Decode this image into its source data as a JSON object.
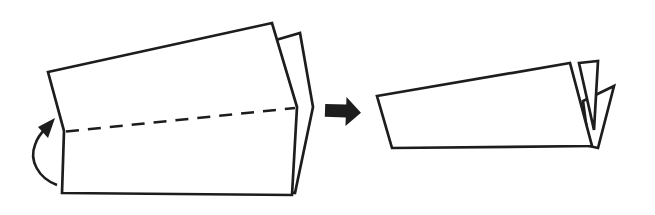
{
  "colors": {
    "background": "#ffffff",
    "paper": "#ffffff",
    "line": "#1d1d1d",
    "arrow_fill": "#1d1d1d"
  },
  "diagram": {
    "type": "origami-instruction-step",
    "step_meaning": "valley-fold bottom half up along dashed crease, result shown at right",
    "left_figure": {
      "back_layer_points": "262,44 300,33 313,107 295,193 262,188",
      "front_layer_points": "48,72 272,23 297,107 292,195 62,193 64,131",
      "fold_line_d": "M 66,131.5 L 295,108",
      "fold_line_dash": "13 9",
      "fold_arrow_arc_d": "M 57,185 C 38,178 29,160 35,145 C 37,138 41,133 46,128",
      "fold_arrow_head_points": "55,118 38,127 48,138"
    },
    "step_arrow": {
      "points": "325,104.5 346,104.5 346,97 361,112 346,126 346,117.5 325,117.5",
      "rotation": "rotate(2 343 111)"
    },
    "right_figure": {
      "back_triangle_points": "614,86 583,101 589,146 598,148",
      "middle_triangle_points": "579,63 598,61 594,130",
      "front_layer_points": "377,96 570,63 592,146 392,148"
    }
  }
}
